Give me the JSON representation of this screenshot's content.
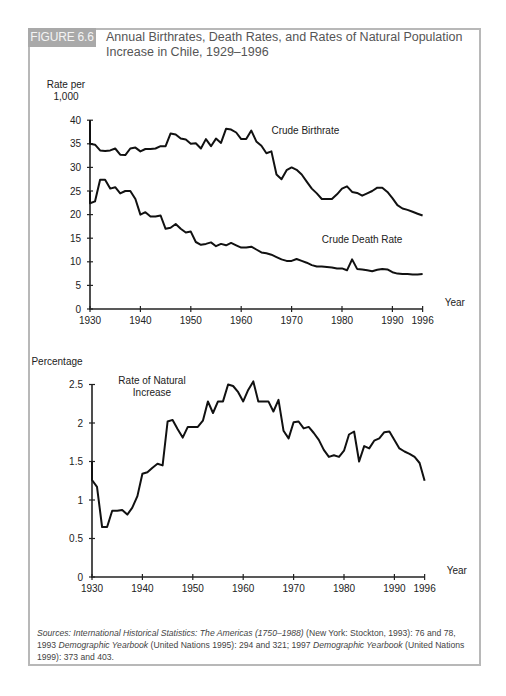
{
  "figure": {
    "badge": "FIGURE 6.6",
    "title_line1": "Annual Birthrates, Death Rates, and Rates of Natural Population",
    "title_line2": "Increase in Chile, 1929–1996"
  },
  "source": {
    "prefix": "Sources: International Historical Statistics: The Americas (1750–1988)",
    "part1": " (New York: Stockton, 1993): 76 and 78, 1993 ",
    "italic2": "Demographic Yearbook",
    "part2": " (United Nations 1995): 294 and 321; 1997 ",
    "italic3": "Demographic Yearbook",
    "part3": " (United Nations 1999): 373 and 403."
  },
  "chart_data": [
    {
      "type": "line",
      "title": "Annual Birthrates and Death Rates in Chile, 1929–1996",
      "ylabel": "Rate per 1,000",
      "xlabel": "Year",
      "ylim": [
        0,
        40
      ],
      "xlim": [
        1929,
        1996
      ],
      "yticks": [
        0,
        5,
        10,
        15,
        20,
        25,
        30,
        35,
        40
      ],
      "xticks": [
        1930,
        1940,
        1950,
        1960,
        1970,
        1980,
        1990,
        1996
      ],
      "grid": false,
      "x": [
        1929,
        1930,
        1931,
        1932,
        1933,
        1934,
        1935,
        1936,
        1937,
        1938,
        1939,
        1940,
        1941,
        1942,
        1943,
        1944,
        1945,
        1946,
        1947,
        1948,
        1949,
        1950,
        1951,
        1952,
        1953,
        1954,
        1955,
        1956,
        1957,
        1958,
        1959,
        1960,
        1961,
        1962,
        1963,
        1964,
        1965,
        1966,
        1967,
        1968,
        1969,
        1970,
        1971,
        1972,
        1973,
        1974,
        1975,
        1976,
        1977,
        1978,
        1979,
        1980,
        1981,
        1982,
        1983,
        1984,
        1985,
        1986,
        1987,
        1988,
        1989,
        1990,
        1991,
        1992,
        1993,
        1994,
        1995,
        1996
      ],
      "series": [
        {
          "name": "Crude Birthrate",
          "label_pos": [
            1966,
            37
          ],
          "values": [
            40.0,
            35.0,
            34.8,
            33.6,
            33.5,
            33.6,
            34.0,
            32.7,
            32.6,
            34.0,
            34.2,
            33.4,
            33.9,
            33.9,
            34.0,
            34.5,
            34.5,
            37.2,
            37.0,
            36.1,
            35.9,
            35.0,
            35.1,
            34.0,
            36.0,
            34.5,
            36.1,
            35.2,
            38.2,
            38.0,
            37.4,
            36.0,
            36.0,
            37.8,
            35.5,
            34.6,
            33.0,
            33.4,
            28.5,
            27.5,
            29.4,
            30.0,
            29.5,
            28.5,
            27.0,
            25.5,
            24.5,
            23.3,
            23.3,
            23.3,
            24.3,
            25.5,
            26.0,
            24.8,
            24.6,
            24.0,
            24.5,
            25.0,
            25.7,
            25.7,
            24.8,
            23.5,
            22.0,
            21.3,
            21.0,
            20.6,
            20.2,
            19.8
          ]
        },
        {
          "name": "Crude Death Rate",
          "label_pos": [
            1976,
            14
          ],
          "values": [
            25.0,
            22.4,
            22.8,
            27.4,
            27.4,
            25.5,
            25.8,
            24.5,
            25.0,
            25.0,
            23.3,
            20.0,
            20.5,
            19.6,
            19.6,
            19.8,
            17.0,
            17.2,
            18.0,
            17.0,
            16.2,
            16.4,
            14.2,
            13.6,
            13.8,
            14.1,
            13.3,
            13.8,
            13.5,
            14.0,
            13.5,
            13.0,
            13.0,
            13.2,
            12.6,
            12.0,
            11.8,
            11.5,
            11.0,
            10.5,
            10.2,
            10.2,
            10.6,
            10.2,
            9.8,
            9.3,
            9.0,
            9.0,
            8.9,
            8.8,
            8.6,
            8.6,
            8.2,
            10.5,
            8.5,
            8.4,
            8.2,
            8.0,
            8.3,
            8.5,
            8.4,
            7.8,
            7.5,
            7.4,
            7.4,
            7.3,
            7.3,
            7.4
          ]
        }
      ]
    },
    {
      "type": "line",
      "title": "Rate of Natural Population Increase in Chile, 1929–1996",
      "ylabel": "Percentage",
      "xlabel": "Year",
      "ylim": [
        0,
        2.5
      ],
      "xlim": [
        1929,
        1996
      ],
      "yticks": [
        0,
        0.5,
        1,
        1.5,
        2,
        2.5
      ],
      "xticks": [
        1930,
        1940,
        1950,
        1960,
        1970,
        1980,
        1990,
        1996
      ],
      "grid": false,
      "x": [
        1929,
        1930,
        1931,
        1932,
        1933,
        1934,
        1935,
        1936,
        1937,
        1938,
        1939,
        1940,
        1941,
        1942,
        1943,
        1944,
        1945,
        1946,
        1947,
        1948,
        1949,
        1950,
        1951,
        1952,
        1953,
        1954,
        1955,
        1956,
        1957,
        1958,
        1959,
        1960,
        1961,
        1962,
        1963,
        1964,
        1965,
        1966,
        1967,
        1968,
        1969,
        1970,
        1971,
        1972,
        1973,
        1974,
        1975,
        1976,
        1977,
        1978,
        1979,
        1980,
        1981,
        1982,
        1983,
        1984,
        1985,
        1986,
        1987,
        1988,
        1989,
        1990,
        1991,
        1992,
        1993,
        1994,
        1995,
        1996
      ],
      "series": [
        {
          "name": "Rate of Natural Increase",
          "label_pos": [
            1940,
            2.3
          ],
          "values": [
            1.5,
            1.26,
            1.17,
            0.65,
            0.65,
            0.86,
            0.86,
            0.87,
            0.81,
            0.9,
            1.05,
            1.34,
            1.36,
            1.42,
            1.47,
            1.45,
            2.02,
            2.04,
            1.92,
            1.81,
            1.95,
            1.95,
            1.95,
            2.03,
            2.28,
            2.13,
            2.28,
            2.28,
            2.5,
            2.48,
            2.4,
            2.28,
            2.43,
            2.54,
            2.28,
            2.28,
            2.28,
            2.15,
            2.3,
            1.9,
            1.8,
            2.01,
            2.02,
            1.93,
            1.95,
            1.87,
            1.78,
            1.65,
            1.56,
            1.58,
            1.56,
            1.64,
            1.85,
            1.89,
            1.5,
            1.7,
            1.67,
            1.77,
            1.8,
            1.88,
            1.89,
            1.78,
            1.67,
            1.63,
            1.6,
            1.56,
            1.48,
            1.25
          ]
        }
      ]
    }
  ],
  "axis_labels": {
    "top_ylabel_1": "Rate per",
    "top_ylabel_2": "1,000",
    "bottom_ylabel": "Percentage",
    "xlabel": "Year"
  }
}
